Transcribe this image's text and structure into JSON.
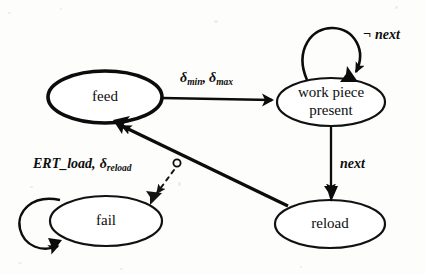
{
  "diagram": {
    "type": "state-transition-diagram",
    "background_color": "#fdfdfc",
    "ink_color": "#0c0c0c",
    "nodes": [
      {
        "id": "feed",
        "label": "feed",
        "label_lines": [
          "feed"
        ],
        "cx": 105,
        "cy": 97,
        "rx": 57,
        "ry": 26,
        "emphasis": "thick"
      },
      {
        "id": "wpp",
        "label": "work piece present",
        "label_lines": [
          "work piece",
          "present"
        ],
        "cx": 331,
        "cy": 102,
        "rx": 54,
        "ry": 24,
        "emphasis": "thin"
      },
      {
        "id": "fail",
        "label": "fail",
        "label_lines": [
          "fail"
        ],
        "cx": 106,
        "cy": 221,
        "rx": 56,
        "ry": 25,
        "emphasis": "thin"
      },
      {
        "id": "reload",
        "label": "reload",
        "label_lines": [
          "reload"
        ],
        "cx": 330,
        "cy": 224,
        "rx": 55,
        "ry": 24,
        "emphasis": "thin"
      }
    ],
    "edges": [
      {
        "id": "feed-to-wpp",
        "from": "feed",
        "to": "wpp",
        "style": "solid",
        "label": "δmin, δmax",
        "label_parts": [
          {
            "text": "δ",
            "sub": "min"
          },
          {
            "text": ", "
          },
          {
            "text": "δ",
            "sub": "max"
          }
        ]
      },
      {
        "id": "wpp-self-loop",
        "from": "wpp",
        "to": "wpp",
        "style": "solid",
        "label": "¬ next",
        "label_parts": [
          {
            "text": "¬ next"
          }
        ]
      },
      {
        "id": "wpp-to-reload",
        "from": "wpp",
        "to": "reload",
        "style": "solid",
        "label": "next",
        "label_parts": [
          {
            "text": "next"
          }
        ]
      },
      {
        "id": "reload-to-feed",
        "from": "reload",
        "to": "feed",
        "style": "solid",
        "label": "ERT_load, δreload",
        "label_parts": [
          {
            "text": "ERT_load, "
          },
          {
            "text": "δ",
            "sub": "reload"
          }
        ]
      },
      {
        "id": "branch-to-fail",
        "from": "reload-to-feed",
        "to": "fail",
        "style": "dashed",
        "label": "",
        "label_parts": []
      },
      {
        "id": "fail-self-loop",
        "from": "fail",
        "to": "fail",
        "style": "solid",
        "label": "",
        "label_parts": []
      }
    ],
    "labels": {
      "delta_min": "δ",
      "delta_min_sub": "min",
      "delta_max": "δ",
      "delta_max_sub": "max",
      "delta_sep": ",",
      "not_next": "¬ next",
      "next": "next",
      "ert_load": "ERT_load,",
      "delta_reload": "δ",
      "delta_reload_sub": "reload"
    }
  }
}
